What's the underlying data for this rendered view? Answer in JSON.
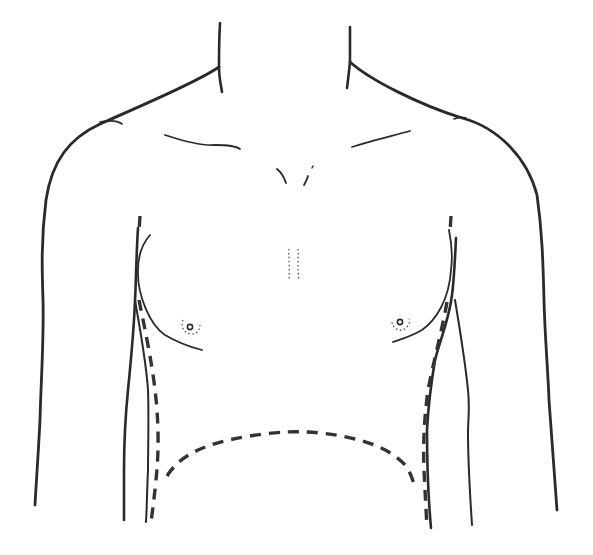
{
  "figure": {
    "type": "anatomical-line-drawing",
    "colors": {
      "background": "#ffffff",
      "line": "#2a2a2a",
      "dashed_line": "#333333"
    },
    "elements": [
      "neck-outline",
      "shoulder-outline",
      "arm-outline",
      "clavicle-lines",
      "sternal-notch-marks",
      "sternum-dotted-marks",
      "breast-contour",
      "nipple-marks",
      "torso-side-outline",
      "dashed-lateral-lines",
      "dashed-inframammary-arc"
    ]
  }
}
